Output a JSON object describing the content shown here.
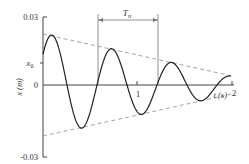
{
  "chart_data": {
    "type": "line",
    "title": "",
    "xlabel": "t (s)",
    "ylabel": "x (m)",
    "ylim": [
      -0.03,
      0.03
    ],
    "xlim": [
      0,
      2
    ],
    "y_ticks": [
      "0.03",
      "x0",
      "0",
      "-0.03"
    ],
    "x_ticks": [
      "1",
      "2"
    ],
    "annotations": [
      {
        "text": "Tn",
        "meaning": "damped natural period, dimension line between two successive peaks"
      },
      {
        "text": "x0",
        "meaning": "initial displacement"
      }
    ],
    "series": [
      {
        "name": "displacement",
        "style": "solid",
        "description": "underdamped free vibration, decaying oscillation"
      },
      {
        "name": "upper envelope",
        "style": "dashed",
        "x": [
          0,
          2
        ],
        "y": [
          0.0219,
          0.0039
        ]
      },
      {
        "name": "lower envelope",
        "style": "dashed",
        "x": [
          0,
          2
        ],
        "y": [
          -0.0219,
          -0.0039
        ]
      }
    ],
    "grid": false,
    "legend": "none"
  },
  "labels": {
    "y_top": "0.03",
    "y_bottom": "-0.03",
    "y_x0": "x",
    "y_x0_sub": "0",
    "y_zero": "0",
    "y_axis_title": "x  (m)",
    "x_tick_1": "1",
    "x_tick_2": "2",
    "x_axis_title": "t (s)",
    "period": "T",
    "period_sub": "n"
  }
}
